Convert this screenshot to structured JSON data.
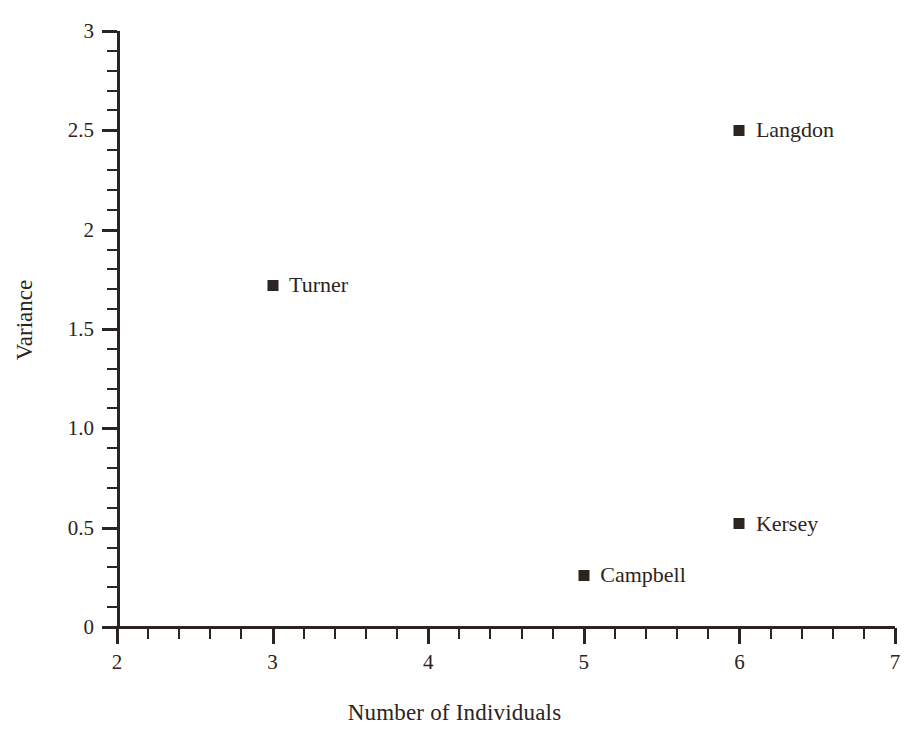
{
  "chart_data": {
    "type": "scatter",
    "title": "",
    "xlabel": "Number of Individuals",
    "ylabel": "Variance",
    "xlim": [
      2,
      7
    ],
    "ylim": [
      0,
      3
    ],
    "grid": false,
    "legend": "none (points labeled inline)",
    "marker": "filled-square",
    "marker_color": "#2b2420",
    "x_major_ticks": [
      2,
      3,
      4,
      5,
      6,
      7
    ],
    "x_tick_labels": [
      "2",
      "3",
      "4",
      "5",
      "6",
      "7"
    ],
    "x_minor_step": 0.2,
    "y_major_ticks": [
      0,
      0.5,
      1.0,
      1.5,
      2,
      2.5,
      3
    ],
    "y_tick_labels": [
      "0",
      "0.5",
      "1.0",
      "1.5",
      "2",
      "2.5",
      "3"
    ],
    "y_minor_step": 0.1,
    "points": [
      {
        "label": "Langdon",
        "x": 6,
        "y": 2.5,
        "label_side": "right"
      },
      {
        "label": "Turner",
        "x": 3,
        "y": 1.72,
        "label_side": "right"
      },
      {
        "label": "Kersey",
        "x": 6,
        "y": 0.52,
        "label_side": "right"
      },
      {
        "label": "Campbell",
        "x": 5,
        "y": 0.26,
        "label_side": "right"
      }
    ]
  },
  "axes": {
    "x_title": "Number of Individuals",
    "y_title": "Variance"
  },
  "colors": {
    "ink": "#2b2420",
    "background": "#ffffff"
  }
}
